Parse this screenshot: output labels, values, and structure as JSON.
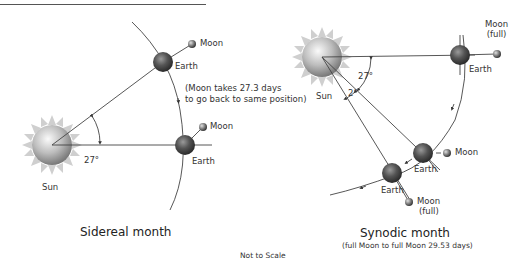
{
  "header": {
    "title_partial": ""
  },
  "sidereal": {
    "caption": "Sidereal month",
    "sun_label": "Sun",
    "earth_label_top": "Earth",
    "moon_label_top": "Moon",
    "earth_label_bottom": "Earth",
    "moon_label_bottom": "Moon",
    "angle_label": "27°",
    "note_line1": "(Moon takes 27.3 days",
    "note_line2": "to go back to same position)"
  },
  "synodic": {
    "caption": "Synodic month",
    "subcaption": "(full Moon to full Moon 29.53 days)",
    "sun_label": "Sun",
    "earth_label_top": "Earth",
    "moon_label_top_line1": "Moon",
    "moon_label_top_line2": "(full)",
    "earth_label_middle": "Earth",
    "moon_label_middle": "Moon",
    "earth_label_bottom": "Earth",
    "moon_label_bottom_line1": "Moon",
    "moon_label_bottom_line2": "(full)",
    "angle_label_large": "27°",
    "angle_label_small": "2°"
  },
  "footer": {
    "scale_note": "Not to Scale"
  },
  "colors": {
    "line": "#444444",
    "sun_core": "#b0b0b0",
    "sun_rays": "#c8c8c8",
    "earth": "#4a4a4a",
    "moon": "#6a6a6a"
  }
}
